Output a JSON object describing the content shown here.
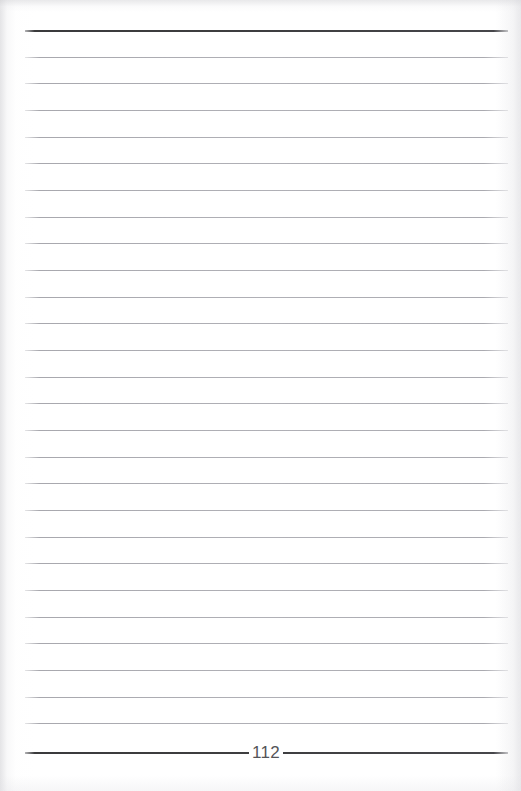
{
  "page": {
    "kind": "scanned-lined-notebook-page",
    "width": 521,
    "height": 791,
    "background_color": "#ffffff",
    "content_text": ""
  },
  "rules": {
    "count": 28,
    "left_x": 25,
    "right_x": 508,
    "first_y": 30,
    "spacing": 26.7,
    "thin_color": "#b5b5ba",
    "heavy_color": "#3a3a3c",
    "heavy_indices": [
      0,
      27
    ],
    "items": [
      {
        "index": 0,
        "y": 30,
        "weight": "heavy"
      },
      {
        "index": 1,
        "y": 57,
        "weight": "thin"
      },
      {
        "index": 2,
        "y": 83,
        "weight": "thin"
      },
      {
        "index": 3,
        "y": 110,
        "weight": "thin"
      },
      {
        "index": 4,
        "y": 137,
        "weight": "thin"
      },
      {
        "index": 5,
        "y": 163,
        "weight": "thin"
      },
      {
        "index": 6,
        "y": 190,
        "weight": "thin"
      },
      {
        "index": 7,
        "y": 217,
        "weight": "thin"
      },
      {
        "index": 8,
        "y": 243,
        "weight": "thin"
      },
      {
        "index": 9,
        "y": 270,
        "weight": "thin"
      },
      {
        "index": 10,
        "y": 297,
        "weight": "thin"
      },
      {
        "index": 11,
        "y": 323,
        "weight": "thin"
      },
      {
        "index": 12,
        "y": 350,
        "weight": "thin"
      },
      {
        "index": 13,
        "y": 377,
        "weight": "thin"
      },
      {
        "index": 14,
        "y": 403,
        "weight": "thin"
      },
      {
        "index": 15,
        "y": 430,
        "weight": "thin"
      },
      {
        "index": 16,
        "y": 457,
        "weight": "thin"
      },
      {
        "index": 17,
        "y": 483,
        "weight": "thin"
      },
      {
        "index": 18,
        "y": 510,
        "weight": "thin"
      },
      {
        "index": 19,
        "y": 537,
        "weight": "thin"
      },
      {
        "index": 20,
        "y": 563,
        "weight": "thin"
      },
      {
        "index": 21,
        "y": 590,
        "weight": "thin"
      },
      {
        "index": 22,
        "y": 617,
        "weight": "thin"
      },
      {
        "index": 23,
        "y": 643,
        "weight": "thin"
      },
      {
        "index": 24,
        "y": 670,
        "weight": "thin"
      },
      {
        "index": 25,
        "y": 697,
        "weight": "thin"
      },
      {
        "index": 26,
        "y": 723,
        "weight": "thin"
      },
      {
        "index": 27,
        "y": 752,
        "weight": "heavy"
      }
    ]
  },
  "page_number": {
    "label": "112",
    "center_x": 266,
    "center_y": 752,
    "color": "#545458",
    "font_size": 17
  }
}
